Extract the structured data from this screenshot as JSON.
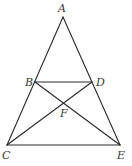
{
  "diagram": {
    "type": "geometry-figure",
    "stroke_color": "#2a2a2a",
    "label_color": "#3a3a3a",
    "points": {
      "A": {
        "label": "A",
        "x": 63,
        "y": 17,
        "lx": 58,
        "ly": 12
      },
      "B": {
        "label": "B",
        "x": 35,
        "y": 82,
        "lx": 25,
        "ly": 86
      },
      "D": {
        "label": "D",
        "x": 92,
        "y": 82,
        "lx": 96,
        "ly": 86
      },
      "F": {
        "label": "F",
        "x": 63,
        "y": 103,
        "lx": 60,
        "ly": 117
      },
      "C": {
        "label": "C",
        "x": 7,
        "y": 145,
        "lx": 2,
        "ly": 159
      },
      "E": {
        "label": "E",
        "x": 120,
        "y": 145,
        "lx": 117,
        "ly": 159
      }
    },
    "segments": [
      {
        "name": "AC",
        "from": "A",
        "to": "C"
      },
      {
        "name": "AE",
        "from": "A",
        "to": "E"
      },
      {
        "name": "BD",
        "from": "B",
        "to": "D"
      },
      {
        "name": "CE",
        "from": "C",
        "to": "E"
      },
      {
        "name": "BE",
        "from": "B",
        "to": "E"
      },
      {
        "name": "CD",
        "from": "C",
        "to": "D"
      }
    ]
  }
}
